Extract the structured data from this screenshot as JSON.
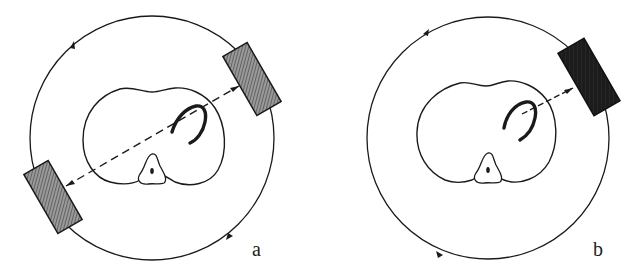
{
  "figure": {
    "panels": [
      {
        "id": "a",
        "label": "a",
        "description": "Two opposed detectors rotating on a circular orbit around a body cross-section, with a dashed line of response through a curved structure",
        "detectors": 2,
        "detector_fill": "hatched-gray",
        "rotation_arrows": 2
      },
      {
        "id": "b",
        "label": "b",
        "description": "Single detector rotating on a circular orbit around a body cross-section, with a dashed line toward a curved structure",
        "detectors": 1,
        "detector_fill": "dark-textured",
        "rotation_arrows": 2
      }
    ],
    "colors": {
      "line": "#1a1a1a",
      "hatch_gray": "#6a6a6a",
      "dark_fill": "#1c1c1c",
      "background": "#ffffff"
    }
  }
}
